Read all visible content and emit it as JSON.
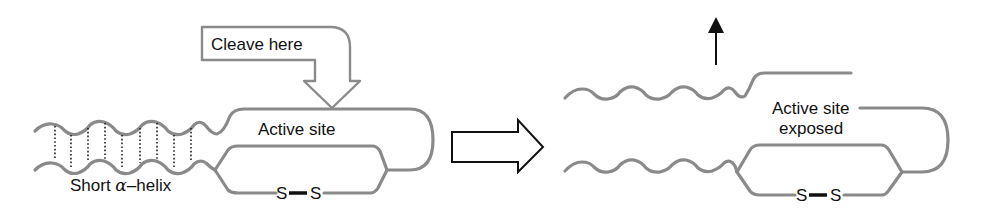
{
  "figure": {
    "type": "protein activation by proteolytic cleavage",
    "colors": {
      "chain": "#8a8a8a",
      "text": "#111111",
      "background": "#ffffff"
    }
  },
  "left_panel": {
    "cleave_label": "Cleave here",
    "active_site_label": "Active site",
    "helix_label_prefix": "Short ",
    "helix_label_greek": "α",
    "helix_label_suffix": "–helix",
    "disulfide": {
      "atom1": "S",
      "atom2": "S"
    }
  },
  "transition_arrow": {
    "icon": "right-outline-arrow-icon"
  },
  "right_panel": {
    "active_site_line1": "Active site",
    "active_site_line2": "exposed",
    "release_arrow_icon": "up-arrow-icon",
    "disulfide": {
      "atom1": "S",
      "atom2": "S"
    }
  }
}
